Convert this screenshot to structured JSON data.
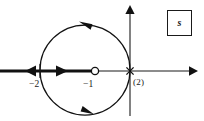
{
  "figure": {
    "kind": "root-locus-plot",
    "background_color": "#ffffff",
    "stroke_color": "#111111"
  },
  "plane_box": {
    "label": "s"
  },
  "axes": {
    "real_axis": {
      "name": "real-axis",
      "y": 71,
      "x_start": 0,
      "x_end": 196,
      "arrow_end": "right"
    },
    "imaginary_axis": {
      "name": "imaginary-axis",
      "x": 130,
      "y_start": 8,
      "y_end": 116,
      "arrow_end": "up"
    }
  },
  "markers": [
    {
      "name": "zero-at-minus-one",
      "type": "zero",
      "symbol": "open-circle",
      "label": "−1",
      "value": -1,
      "x": 95,
      "y": 71
    },
    {
      "name": "pole-at-origin",
      "type": "pole",
      "symbol": "cross",
      "label": "(2)",
      "multiplicity": 2,
      "value": 0,
      "x": 130,
      "y": 71
    },
    {
      "name": "breakaway-at-minus-two",
      "type": "breakaway",
      "symbol": "tick",
      "label": "−2",
      "value": -2,
      "x": 40,
      "y": 71
    }
  ],
  "branches": {
    "real_axis_segment": {
      "name": "real-axis-locus-branch",
      "x_start": 0,
      "x_end": 95,
      "y": 71,
      "thick": true,
      "arrows": [
        {
          "x": 33,
          "direction": "left"
        },
        {
          "x": 61,
          "direction": "right"
        }
      ]
    },
    "circular_locus": {
      "name": "circular-locus-branch",
      "center_x": 85,
      "center_y": 70,
      "radius": 45,
      "arrows": [
        {
          "position": "top",
          "direction": "left"
        },
        {
          "position": "bottom",
          "direction": "right"
        }
      ]
    }
  },
  "labels": {
    "minus_two": "−2",
    "minus_one": "−1",
    "multiplicity_two": "(2)"
  }
}
